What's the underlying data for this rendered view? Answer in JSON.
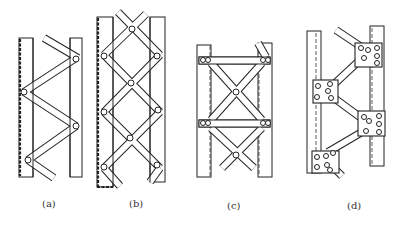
{
  "figure": {
    "panels": [
      {
        "id": "a",
        "label": "(a)",
        "description": "single lacing (zig-zag diagonals)"
      },
      {
        "id": "b",
        "label": "(b)",
        "description": "double lacing (crossed diagonals)"
      },
      {
        "id": "c",
        "label": "(c)",
        "description": "cross bracing with horizontal battens"
      },
      {
        "id": "d",
        "label": "(d)",
        "description": "lacing with gusset plates and bolted connections"
      }
    ]
  },
  "colors": {
    "ink": "#222222",
    "background": "#ffffff"
  }
}
